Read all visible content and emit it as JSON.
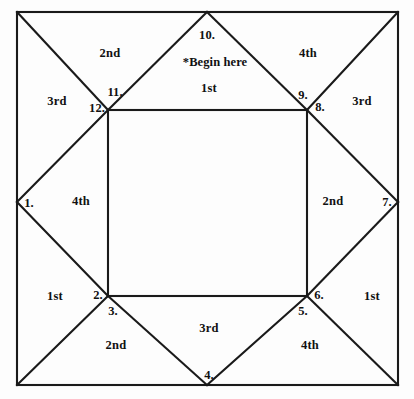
{
  "diagram": {
    "stroke_color": "#1a1a1a",
    "background_color": "#fdfdfd",
    "outer_square": {
      "left": 17,
      "top": 12,
      "right": 398,
      "bottom": 385
    },
    "inner_square": {
      "left": 108,
      "top": 110,
      "right": 307,
      "bottom": 296
    },
    "edge_apexes": {
      "top": {
        "x": 207,
        "y": 12
      },
      "left": {
        "x": 17,
        "y": 202
      },
      "right": {
        "x": 398,
        "y": 202
      },
      "bottom": {
        "x": 207,
        "y": 385
      }
    },
    "begin_note": {
      "text": "*Begin here",
      "x": 215,
      "y": 62
    },
    "point_numbers": [
      {
        "label": "1.",
        "x": 29,
        "y": 203
      },
      {
        "label": "2.",
        "x": 98,
        "y": 295
      },
      {
        "label": "3.",
        "x": 113,
        "y": 311
      },
      {
        "label": "4.",
        "x": 209,
        "y": 375
      },
      {
        "label": "5.",
        "x": 303,
        "y": 311
      },
      {
        "label": "6.",
        "x": 319,
        "y": 295
      },
      {
        "label": "7.",
        "x": 387,
        "y": 202
      },
      {
        "label": "8.",
        "x": 320,
        "y": 107
      },
      {
        "label": "9.",
        "x": 303,
        "y": 95
      },
      {
        "label": "10.",
        "x": 207,
        "y": 35
      },
      {
        "label": "11.",
        "x": 115,
        "y": 92
      },
      {
        "label": "12.",
        "x": 97,
        "y": 108
      }
    ],
    "ordinal_labels": [
      {
        "label": "2nd",
        "x": 110,
        "y": 53
      },
      {
        "label": "4th",
        "x": 308,
        "y": 53
      },
      {
        "label": "3rd",
        "x": 57,
        "y": 101
      },
      {
        "label": "1st",
        "x": 209,
        "y": 88
      },
      {
        "label": "3rd",
        "x": 362,
        "y": 101
      },
      {
        "label": "4th",
        "x": 81,
        "y": 201
      },
      {
        "label": "2nd",
        "x": 333,
        "y": 201
      },
      {
        "label": "1st",
        "x": 55,
        "y": 296
      },
      {
        "label": "1st",
        "x": 372,
        "y": 296
      },
      {
        "label": "3rd",
        "x": 209,
        "y": 328
      },
      {
        "label": "2nd",
        "x": 116,
        "y": 345
      },
      {
        "label": "4th",
        "x": 310,
        "y": 345
      }
    ]
  }
}
